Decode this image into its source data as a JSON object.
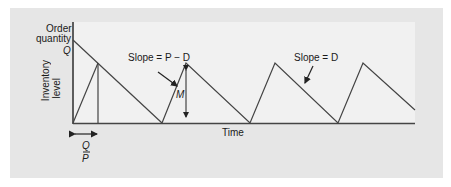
{
  "diagram": {
    "type": "inventory-sawtooth",
    "y_axis": {
      "label_top_line1": "Order",
      "label_top_line2": "quantity",
      "q_label": "Q",
      "side_label_line1": "Inventory",
      "side_label_line2": "level"
    },
    "x_axis": {
      "label": "Time"
    },
    "annotations": {
      "slope_pd": "Slope = P − D",
      "slope_d": "Slope = D",
      "max_label": "M",
      "qp_num": "Q",
      "qp_den": "P"
    },
    "colors": {
      "outer_bg": "#e6e6e6",
      "plot_bg": "#f1f1f1",
      "line": "#3a3a3a"
    }
  }
}
